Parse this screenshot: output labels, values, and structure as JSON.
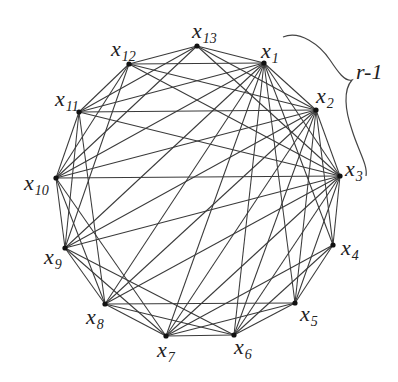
{
  "figure": {
    "type": "graph",
    "nodes": [
      {
        "id": "x1",
        "label": "x",
        "sub": "1",
        "cx": 264,
        "cy": 63,
        "lx": 261,
        "ly": 58
      },
      {
        "id": "x2",
        "label": "x",
        "sub": "2",
        "cx": 316,
        "cy": 110,
        "lx": 316,
        "ly": 103
      },
      {
        "id": "x3",
        "label": "x",
        "sub": "3",
        "cx": 340,
        "cy": 176,
        "lx": 345,
        "ly": 176
      },
      {
        "id": "x4",
        "label": "x",
        "sub": "4",
        "cx": 333,
        "cy": 245,
        "lx": 341,
        "ly": 255
      },
      {
        "id": "x5",
        "label": "x",
        "sub": "5",
        "cx": 295,
        "cy": 303,
        "lx": 300,
        "ly": 321
      },
      {
        "id": "x6",
        "label": "x",
        "sub": "6",
        "cx": 234,
        "cy": 335,
        "lx": 234,
        "ly": 354
      },
      {
        "id": "x7",
        "label": "x",
        "sub": "7",
        "cx": 166,
        "cy": 336,
        "lx": 157,
        "ly": 357
      },
      {
        "id": "x8",
        "label": "x",
        "sub": "8",
        "cx": 105,
        "cy": 304,
        "lx": 86,
        "ly": 324
      },
      {
        "id": "x9",
        "label": "x",
        "sub": "9",
        "cx": 65,
        "cy": 248,
        "lx": 44,
        "ly": 264
      },
      {
        "id": "x10",
        "label": "x",
        "sub": "10",
        "cx": 56,
        "cy": 178,
        "lx": 24,
        "ly": 190
      },
      {
        "id": "x11",
        "label": "x",
        "sub": "11",
        "cx": 79,
        "cy": 112,
        "lx": 55,
        "ly": 106
      },
      {
        "id": "x12",
        "label": "x",
        "sub": "12",
        "cx": 129,
        "cy": 64,
        "lx": 111,
        "ly": 56
      },
      {
        "id": "x13",
        "label": "x",
        "sub": "13",
        "cx": 197,
        "cy": 46,
        "lx": 192,
        "ly": 38
      }
    ],
    "edges": [
      [
        "x1",
        "x2"
      ],
      [
        "x1",
        "x3"
      ],
      [
        "x1",
        "x4"
      ],
      [
        "x1",
        "x5"
      ],
      [
        "x1",
        "x6"
      ],
      [
        "x1",
        "x7"
      ],
      [
        "x1",
        "x8"
      ],
      [
        "x1",
        "x9"
      ],
      [
        "x1",
        "x10"
      ],
      [
        "x1",
        "x11"
      ],
      [
        "x1",
        "x12"
      ],
      [
        "x1",
        "x13"
      ],
      [
        "x2",
        "x3"
      ],
      [
        "x2",
        "x4"
      ],
      [
        "x2",
        "x5"
      ],
      [
        "x2",
        "x6"
      ],
      [
        "x2",
        "x7"
      ],
      [
        "x2",
        "x8"
      ],
      [
        "x2",
        "x9"
      ],
      [
        "x2",
        "x10"
      ],
      [
        "x2",
        "x11"
      ],
      [
        "x2",
        "x12"
      ],
      [
        "x2",
        "x13"
      ],
      [
        "x3",
        "x4"
      ],
      [
        "x3",
        "x5"
      ],
      [
        "x3",
        "x6"
      ],
      [
        "x3",
        "x7"
      ],
      [
        "x3",
        "x8"
      ],
      [
        "x3",
        "x9"
      ],
      [
        "x3",
        "x10"
      ],
      [
        "x3",
        "x11"
      ],
      [
        "x3",
        "x12"
      ],
      [
        "x3",
        "x13"
      ],
      [
        "x4",
        "x5"
      ],
      [
        "x4",
        "x6"
      ],
      [
        "x4",
        "x7"
      ],
      [
        "x5",
        "x6"
      ],
      [
        "x5",
        "x7"
      ],
      [
        "x5",
        "x8"
      ],
      [
        "x6",
        "x7"
      ],
      [
        "x6",
        "x8"
      ],
      [
        "x6",
        "x9"
      ],
      [
        "x7",
        "x8"
      ],
      [
        "x7",
        "x9"
      ],
      [
        "x7",
        "x10"
      ],
      [
        "x8",
        "x9"
      ],
      [
        "x8",
        "x10"
      ],
      [
        "x8",
        "x11"
      ],
      [
        "x9",
        "x10"
      ],
      [
        "x9",
        "x11"
      ],
      [
        "x9",
        "x12"
      ],
      [
        "x10",
        "x11"
      ],
      [
        "x10",
        "x12"
      ],
      [
        "x10",
        "x13"
      ],
      [
        "x11",
        "x12"
      ],
      [
        "x11",
        "x13"
      ],
      [
        "x12",
        "x13"
      ]
    ],
    "brace": {
      "label": "r-1",
      "label_x": 356,
      "label_y": 79,
      "path": "M 283 37 C 300 30, 320 45, 330 60 C 338 72, 345 82, 352 80 C 343 90, 345 110, 352 130 C 358 150, 368 165, 366 176"
    }
  }
}
